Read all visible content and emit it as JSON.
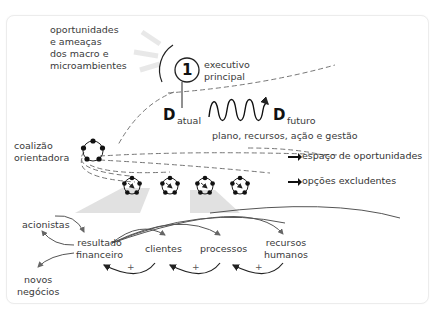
{
  "diagram": {
    "environment_label": [
      "oportunidades",
      "e ameaças",
      "dos macro e",
      "microambientes"
    ],
    "leader": {
      "number": "1",
      "label": [
        "executivo",
        "principal"
      ]
    },
    "transition": {
      "d_letter": "D",
      "current_sub": "atual",
      "future_sub": "futuro",
      "means_label": "plano, recursos, ação e gestão"
    },
    "coalition_label": [
      "coalizão",
      "orientadora"
    ],
    "legend": {
      "opportunity_space": "espaço de oportunidades",
      "exclusive_options": "opções excludentes"
    },
    "outcomes": {
      "shareholders": "acionistas",
      "financial_result": [
        "resultado",
        "financeiro"
      ],
      "clients": "clientes",
      "processes": "processos",
      "human_resources": [
        "recursos",
        "humanos"
      ],
      "new_business": [
        "novos",
        "negócios"
      ],
      "plus_sign": "+"
    },
    "colors": {
      "line": "#222222",
      "dash": "#777777",
      "shade": "#d9d9d9",
      "text": "#3a3a3a"
    }
  }
}
